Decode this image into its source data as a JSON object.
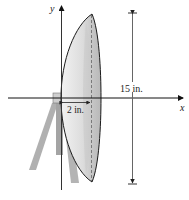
{
  "diagram": {
    "axes": {
      "x_label": "x",
      "y_label": "y"
    },
    "dimensions": {
      "depth_label": "2 in.",
      "diameter_label": "15 in."
    },
    "colors": {
      "dish_fill_light": "#e4e4e4",
      "dish_fill_dark": "#bdbdbd",
      "stand": "#a9a9a9",
      "outline": "#1a1a1a",
      "dim_line": "#555555"
    }
  }
}
